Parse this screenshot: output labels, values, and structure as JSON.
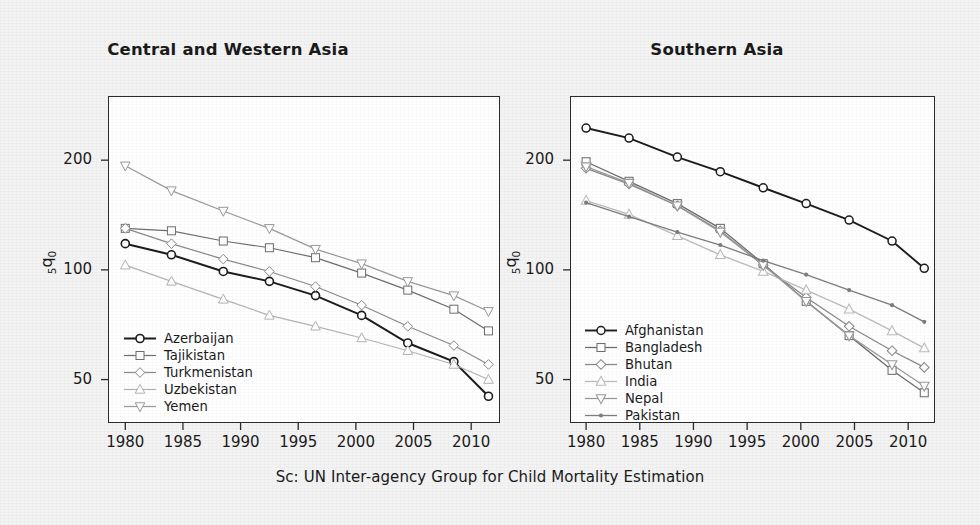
{
  "figure": {
    "caption": "Sc: UN Inter-agency Group for Child Mortality Estimation",
    "background_color": "#f3f3f3",
    "plot_background_color": "#ffffff",
    "axis_color": "#2b2b2b"
  },
  "panels": {
    "left": {
      "title": "Central and Western Asia",
      "ylabel": "5q0",
      "ylabel_sub": "5",
      "ylabel_main": "q",
      "ylabel_sub2": "0"
    },
    "right": {
      "title": "Southern Asia",
      "ylabel": "5q0"
    }
  },
  "axes": {
    "xticks": [
      1980,
      1985,
      1990,
      1995,
      2000,
      2005,
      2010
    ],
    "xtick_labels": [
      "1980",
      "1985",
      "1990",
      "1995",
      "2000",
      "2005",
      "2010"
    ],
    "yticks": [
      50,
      100,
      200
    ],
    "ytick_labels": [
      "50",
      "100",
      "200"
    ],
    "xlim": [
      1978.5,
      2012.5
    ],
    "ylim": [
      38,
      300
    ],
    "yscale": "log",
    "grid": false
  },
  "chart_data": [
    {
      "type": "line",
      "title": "Central and Western Asia",
      "xlabel": "",
      "ylabel": "5q0",
      "yscale": "log",
      "xlim": [
        1978.5,
        2012.5
      ],
      "ylim": [
        38,
        300
      ],
      "legend_position": "bottom-left",
      "x": [
        1980,
        1984,
        1988.5,
        1992.5,
        1996.5,
        2000.5,
        2004.5,
        2008.5,
        2011.5
      ],
      "series": [
        {
          "name": "Azerbaijan",
          "marker": "circle",
          "color": "#1c1c1c",
          "linewidth": 2.0,
          "values": [
            118,
            110,
            99,
            93,
            85,
            75,
            63,
            56,
            45
          ]
        },
        {
          "name": "Tajikistan",
          "marker": "square",
          "color": "#6e6e6e",
          "linewidth": 1.2,
          "values": [
            130,
            128,
            120,
            115,
            108,
            98,
            88,
            78,
            68
          ]
        },
        {
          "name": "Turkmenistan",
          "marker": "diamond",
          "color": "#8a8a8a",
          "linewidth": 1.2,
          "values": [
            130,
            118,
            107,
            99,
            90,
            80,
            70,
            62,
            55
          ]
        },
        {
          "name": "Uzbekistan",
          "marker": "triangle-up",
          "color": "#b4b4b4",
          "linewidth": 1.2,
          "values": [
            103,
            93,
            83,
            75,
            70,
            65,
            60,
            55,
            50
          ]
        },
        {
          "name": "Yemen",
          "marker": "triangle-down",
          "color": "#9a9a9a",
          "linewidth": 1.2,
          "values": [
            193,
            165,
            145,
            130,
            114,
            104,
            93,
            85,
            77
          ]
        }
      ]
    },
    {
      "type": "line",
      "title": "Southern Asia",
      "xlabel": "",
      "ylabel": "5q0",
      "yscale": "log",
      "xlim": [
        1978.5,
        2012.5
      ],
      "ylim": [
        38,
        300
      ],
      "legend_position": "bottom-left",
      "x": [
        1980,
        1984,
        1988.5,
        1992.5,
        1996.5,
        2000.5,
        2004.5,
        2008.5,
        2011.5
      ],
      "series": [
        {
          "name": "Afghanistan",
          "marker": "circle",
          "color": "#1c1c1c",
          "linewidth": 1.9,
          "values": [
            245,
            230,
            204,
            186,
            168,
            152,
            137,
            120,
            101
          ]
        },
        {
          "name": "Bangladesh",
          "marker": "square",
          "color": "#6e6e6e",
          "linewidth": 1.3,
          "values": [
            198,
            175,
            152,
            130,
            104,
            82,
            66,
            53,
            46
          ]
        },
        {
          "name": "Bhutan",
          "marker": "diamond",
          "color": "#8a8a8a",
          "linewidth": 1.3,
          "values": [
            190,
            172,
            150,
            128,
            103,
            84,
            70,
            60,
            54
          ]
        },
        {
          "name": "India",
          "marker": "triangle-up",
          "color": "#bcbcbc",
          "linewidth": 1.3,
          "values": [
            155,
            142,
            124,
            110,
            99,
            88,
            78,
            68,
            61
          ]
        },
        {
          "name": "Nepal",
          "marker": "triangle-down",
          "color": "#9a9a9a",
          "linewidth": 1.3,
          "values": [
            192,
            173,
            150,
            127,
            103,
            82,
            66,
            55,
            48
          ]
        },
        {
          "name": "Pakistan",
          "marker": "dot",
          "color": "#7d7d7d",
          "linewidth": 1.3,
          "values": [
            153,
            140,
            127,
            117,
            106,
            97,
            88,
            80,
            72
          ]
        }
      ]
    }
  ]
}
